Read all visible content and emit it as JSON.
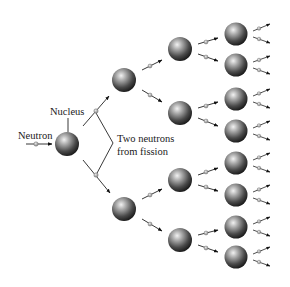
{
  "diagram": {
    "type": "nuclear-chain-reaction",
    "labels": {
      "nucleus": "Nucleus",
      "neutron": "Neutron",
      "fission_line1": "Two neutrons",
      "fission_line2": "from fission"
    },
    "generations": [
      {
        "level": 1,
        "nuclei": 1
      },
      {
        "level": 2,
        "nuclei": 2
      },
      {
        "level": 3,
        "nuclei": 4
      },
      {
        "level": 4,
        "nuclei": 8
      }
    ],
    "neutrons_per_fission": 2,
    "colors": {
      "nucleus_light": "#e8e8e8",
      "nucleus_dark": "#1e1e1e",
      "neutron": "#b8b8b8",
      "arrow": "#111111",
      "text": "#1a1a1a",
      "background": "#ffffff"
    }
  }
}
